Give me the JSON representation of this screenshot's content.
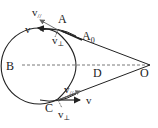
{
  "diagram": {
    "points": {
      "A": "A",
      "A0": "A",
      "A0_sub": "0",
      "B": "B",
      "C": "C",
      "D": "D",
      "O": "O"
    },
    "vectors": {
      "top_v": "v",
      "top_vpar": "v",
      "top_vpar_sub": "//",
      "top_vperp": "v",
      "top_vperp_sub": "⊥",
      "bot_v": "v",
      "bot_vpar": "v",
      "bot_vpar_sub": "//",
      "bot_vperp": "v",
      "bot_vperp_sub": "⊥"
    },
    "colors": {
      "stroke": "#222222",
      "dashed": "#555555"
    }
  }
}
